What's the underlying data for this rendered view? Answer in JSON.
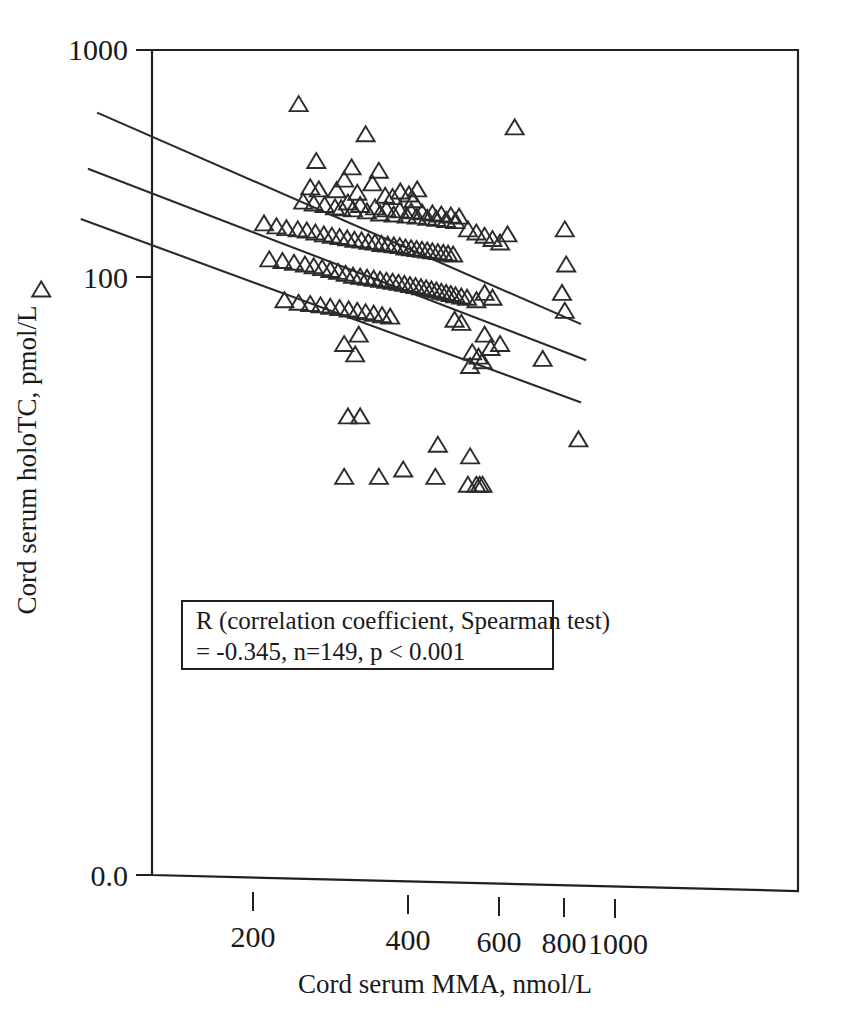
{
  "figure": {
    "background_color": "#ffffff",
    "ink_color": "#231f20"
  },
  "chart_data": {
    "type": "scatter",
    "title": "",
    "xlabel": "Cord serum MMA, nmol/L",
    "ylabel": "Cord serum holoTC, pmol/L",
    "xscale": "log",
    "yscale": "log",
    "xlim": [
      70,
      1000
    ],
    "ylim": [
      10,
      1000
    ],
    "grid": false,
    "legend": null,
    "marker": "open-triangle-up",
    "x_ticks": [
      200,
      400,
      600,
      800,
      1000
    ],
    "x_tick_labels": [
      "200",
      "400",
      "600",
      "800",
      "1000"
    ],
    "y_ticks": [
      100,
      1000
    ],
    "y_tick_labels": [
      "100",
      "1000"
    ],
    "y_axis_origin_label": "0.0",
    "annotations": [
      {
        "line1": "R (correlation coefficient, Spearman test)",
        "line2": "= -0.345, n=149, p < 0.001"
      }
    ],
    "statistics": {
      "r": -0.345,
      "n": 149,
      "p": "< 0.001",
      "test": "Spearman"
    },
    "regression_lines": [
      {
        "name": "upper-confidence-band",
        "x": [
          100,
          860
        ],
        "y": [
          530,
          62
        ]
      },
      {
        "name": "fitted-regression-line",
        "x": [
          96,
          880
        ],
        "y": [
          300,
          43
        ]
      },
      {
        "name": "lower-confidence-band",
        "x": [
          93,
          860
        ],
        "y": [
          180,
          28
        ]
      }
    ],
    "points": [
      [
        78,
        87
      ],
      [
        245,
        570
      ],
      [
        330,
        420
      ],
      [
        265,
        320
      ],
      [
        310,
        300
      ],
      [
        350,
        290
      ],
      [
        300,
        265
      ],
      [
        340,
        255
      ],
      [
        258,
        245
      ],
      [
        268,
        240
      ],
      [
        290,
        238
      ],
      [
        318,
        232
      ],
      [
        360,
        225
      ],
      [
        372,
        222
      ],
      [
        385,
        235
      ],
      [
        400,
        228
      ],
      [
        408,
        215
      ],
      [
        415,
        240
      ],
      [
        250,
        212
      ],
      [
        262,
        208
      ],
      [
        275,
        205
      ],
      [
        288,
        200
      ],
      [
        296,
        198
      ],
      [
        305,
        210
      ],
      [
        312,
        196
      ],
      [
        322,
        205
      ],
      [
        332,
        192
      ],
      [
        344,
        200
      ],
      [
        352,
        188
      ],
      [
        362,
        196
      ],
      [
        374,
        186
      ],
      [
        384,
        194
      ],
      [
        396,
        184
      ],
      [
        404,
        192
      ],
      [
        414,
        182
      ],
      [
        424,
        190
      ],
      [
        434,
        180
      ],
      [
        444,
        188
      ],
      [
        452,
        178
      ],
      [
        462,
        186
      ],
      [
        472,
        176
      ],
      [
        482,
        184
      ],
      [
        492,
        174
      ],
      [
        500,
        182
      ],
      [
        210,
        170
      ],
      [
        222,
        165
      ],
      [
        232,
        162
      ],
      [
        244,
        160
      ],
      [
        254,
        158
      ],
      [
        264,
        155
      ],
      [
        274,
        152
      ],
      [
        284,
        150
      ],
      [
        294,
        148
      ],
      [
        304,
        146
      ],
      [
        314,
        144
      ],
      [
        324,
        143
      ],
      [
        334,
        141
      ],
      [
        344,
        140
      ],
      [
        354,
        138
      ],
      [
        364,
        137
      ],
      [
        374,
        136
      ],
      [
        384,
        135
      ],
      [
        394,
        133
      ],
      [
        404,
        132
      ],
      [
        414,
        131
      ],
      [
        424,
        130
      ],
      [
        434,
        129
      ],
      [
        444,
        128
      ],
      [
        455,
        127
      ],
      [
        466,
        126
      ],
      [
        476,
        125
      ],
      [
        487,
        124
      ],
      [
        520,
        160
      ],
      [
        540,
        155
      ],
      [
        560,
        150
      ],
      [
        580,
        145
      ],
      [
        600,
        140
      ],
      [
        620,
        152
      ],
      [
        640,
        450
      ],
      [
        800,
        160
      ],
      [
        805,
        112
      ],
      [
        790,
        84
      ],
      [
        800,
        70
      ],
      [
        215,
        118
      ],
      [
        228,
        116
      ],
      [
        240,
        114
      ],
      [
        252,
        112
      ],
      [
        262,
        110
      ],
      [
        272,
        108
      ],
      [
        282,
        106
      ],
      [
        292,
        104
      ],
      [
        302,
        102
      ],
      [
        312,
        100
      ],
      [
        322,
        99
      ],
      [
        332,
        98
      ],
      [
        342,
        97
      ],
      [
        352,
        96
      ],
      [
        362,
        95
      ],
      [
        372,
        94
      ],
      [
        382,
        93
      ],
      [
        392,
        92
      ],
      [
        402,
        91
      ],
      [
        412,
        90
      ],
      [
        422,
        89
      ],
      [
        432,
        88
      ],
      [
        442,
        87
      ],
      [
        452,
        86
      ],
      [
        462,
        85
      ],
      [
        472,
        84
      ],
      [
        482,
        83
      ],
      [
        492,
        82
      ],
      [
        505,
        81
      ],
      [
        518,
        80
      ],
      [
        230,
        78
      ],
      [
        245,
        76
      ],
      [
        258,
        75
      ],
      [
        270,
        74
      ],
      [
        282,
        73
      ],
      [
        294,
        72
      ],
      [
        306,
        71
      ],
      [
        318,
        70
      ],
      [
        330,
        69
      ],
      [
        342,
        68
      ],
      [
        355,
        67
      ],
      [
        368,
        66
      ],
      [
        490,
        64
      ],
      [
        505,
        62
      ],
      [
        540,
        78
      ],
      [
        560,
        84
      ],
      [
        580,
        80
      ],
      [
        530,
        46
      ],
      [
        545,
        44
      ],
      [
        525,
        40
      ],
      [
        555,
        42
      ],
      [
        575,
        48
      ],
      [
        600,
        50
      ],
      [
        300,
        50
      ],
      [
        315,
        45
      ],
      [
        320,
        55
      ],
      [
        725,
        43
      ],
      [
        560,
        55
      ],
      [
        305,
        24
      ],
      [
        322,
        24
      ],
      [
        455,
        18
      ],
      [
        850,
        19
      ],
      [
        525,
        16
      ],
      [
        300,
        13
      ],
      [
        350,
        13
      ],
      [
        390,
        14
      ],
      [
        450,
        13
      ],
      [
        520,
        12
      ],
      [
        540,
        12
      ],
      [
        548,
        12
      ],
      [
        555,
        12
      ]
    ]
  }
}
